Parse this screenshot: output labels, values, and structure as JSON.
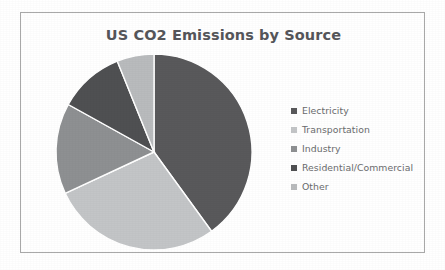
{
  "frame": {
    "border_color": "#a9a9a9",
    "background": "#ffffff"
  },
  "chart_data": {
    "type": "pie",
    "title": "US CO2 Emissions by Source",
    "xlabel": "",
    "ylabel": "",
    "legend_position": "right",
    "grid": false,
    "start_angle_deg": 0,
    "direction": "clockwise",
    "categories": [
      "Electricity",
      "Transportation",
      "Industry",
      "Residential/Commercial",
      "Other"
    ],
    "values": [
      40,
      28,
      15,
      11,
      6
    ],
    "unit": "percent",
    "colors": [
      "#59595b",
      "#c3c5c7",
      "#8e9092",
      "#4f5052",
      "#b9bbbd"
    ],
    "slices": [
      {
        "label": "Electricity",
        "value": 40,
        "color": "#59595b",
        "start_deg": 0,
        "end_deg": 144
      },
      {
        "label": "Transportation",
        "value": 28,
        "color": "#c3c5c7",
        "start_deg": 144,
        "end_deg": 245
      },
      {
        "label": "Industry",
        "value": 15,
        "color": "#8e9092",
        "start_deg": 245,
        "end_deg": 299
      },
      {
        "label": "Residential/Commercial",
        "value": 11,
        "color": "#4f5052",
        "start_deg": 299,
        "end_deg": 338
      },
      {
        "label": "Other",
        "value": 6,
        "color": "#b9bbbd",
        "start_deg": 338,
        "end_deg": 360
      }
    ]
  },
  "legend": {
    "items": [
      {
        "label": "Electricity",
        "color": "#59595b"
      },
      {
        "label": "Transportation",
        "color": "#c3c5c7"
      },
      {
        "label": "Industry",
        "color": "#8e9092"
      },
      {
        "label": "Residential/Commercial",
        "color": "#4f5052"
      },
      {
        "label": "Other",
        "color": "#b9bbbd"
      }
    ]
  }
}
